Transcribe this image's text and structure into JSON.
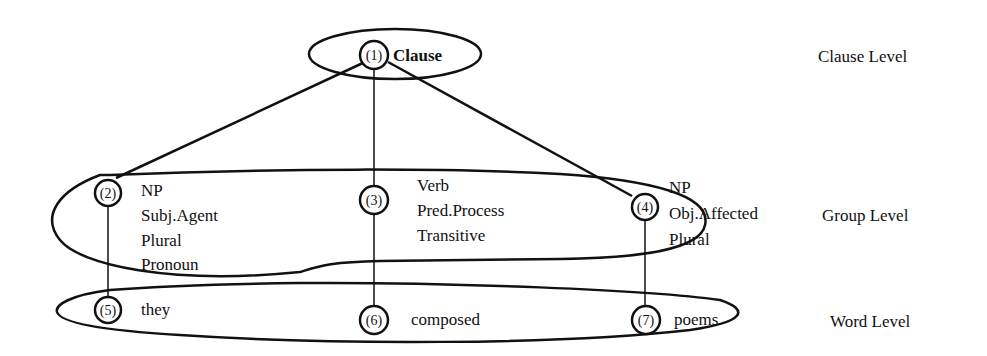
{
  "diagram": {
    "type": "linguistic-rank-structure",
    "levels": [
      {
        "id": "clause",
        "label": "Clause Level"
      },
      {
        "id": "group",
        "label": "Group Level"
      },
      {
        "id": "word",
        "label": "Word Level"
      }
    ],
    "nodes": [
      {
        "id": "1",
        "num": "(1)",
        "features": [
          "Clause"
        ],
        "level": "clause"
      },
      {
        "id": "2",
        "num": "(2)",
        "features": [
          "NP",
          "Subj.Agent",
          "Plural",
          "Pronoun"
        ],
        "level": "group"
      },
      {
        "id": "3",
        "num": "(3)",
        "features": [
          "Verb",
          "Pred.Process",
          "Transitive"
        ],
        "level": "group"
      },
      {
        "id": "4",
        "num": "(4)",
        "features": [
          "NP",
          "Obj.Affected",
          "Plural"
        ],
        "level": "group"
      },
      {
        "id": "5",
        "num": "(5)",
        "features": [
          "they"
        ],
        "level": "word"
      },
      {
        "id": "6",
        "num": "(6)",
        "features": [
          "composed"
        ],
        "level": "word"
      },
      {
        "id": "7",
        "num": "(7)",
        "features": [
          "poems"
        ],
        "level": "word"
      }
    ],
    "edges": [
      {
        "from": "1",
        "to": "2"
      },
      {
        "from": "1",
        "to": "3"
      },
      {
        "from": "1",
        "to": "4"
      },
      {
        "from": "2",
        "to": "5"
      },
      {
        "from": "3",
        "to": "6"
      },
      {
        "from": "4",
        "to": "7"
      }
    ],
    "colors": {
      "ink": "#111111",
      "background": "#ffffff"
    }
  }
}
